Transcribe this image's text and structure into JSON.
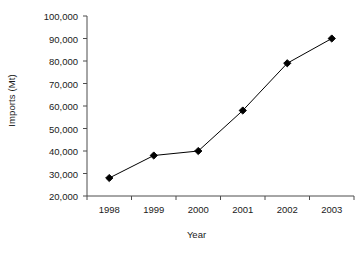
{
  "chart_data": {
    "type": "line",
    "title": "",
    "subtitle": "",
    "xlabel": "Year",
    "ylabel": "Imports (Mt)",
    "categories": [
      "1998",
      "1999",
      "2000",
      "2001",
      "2002",
      "2003"
    ],
    "values": [
      28000,
      38000,
      40000,
      58000,
      79000,
      90000
    ],
    "series": [
      {
        "name": "Imports",
        "values": [
          28000,
          38000,
          40000,
          58000,
          79000,
          90000
        ]
      }
    ],
    "ylim": [
      20000,
      100000
    ],
    "ytick_step": 10000,
    "ytick_labels": [
      "100,000",
      "90,000",
      "80,000",
      "70,000",
      "60,000",
      "50,000",
      "40,000",
      "30,000",
      "20,000"
    ],
    "ytick_values": [
      100000,
      90000,
      80000,
      70000,
      60000,
      50000,
      40000,
      30000,
      20000
    ],
    "xtick_labels": [
      "1998",
      "1999",
      "2000",
      "2001",
      "2002",
      "2003"
    ],
    "grid": false,
    "legend": false,
    "legend_position": "none",
    "marker": "diamond",
    "line_color": "#000000",
    "marker_color": "#000000",
    "axis_color": "#4d4d4d",
    "background_color": "#ffffff"
  }
}
